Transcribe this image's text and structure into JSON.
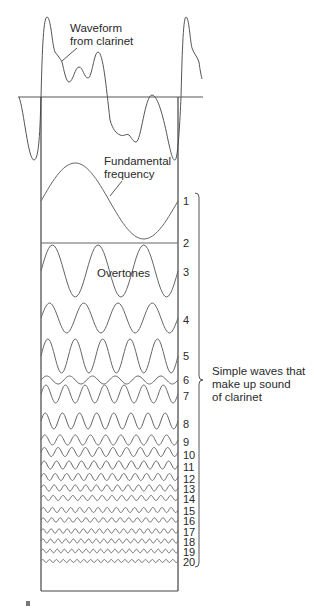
{
  "labels": {
    "waveform_line1": "Waveform",
    "waveform_line2": "from clarinet",
    "fundamental_line1": "Fundamental",
    "fundamental_line2": "frequency",
    "overtones": "Overtones",
    "bracket_line1": "Simple waves that",
    "bracket_line2": "make up sound",
    "bracket_line3": "of clarinet"
  },
  "colors": {
    "line": "#555555",
    "wave": "#666666",
    "text": "#2a2a2a"
  },
  "box": {
    "x1": 41,
    "x2": 178,
    "top": 97,
    "bottom": 591
  },
  "axis": {
    "y": 97,
    "x1": 18,
    "x2": 203
  },
  "harmonics": [
    {
      "n": "1",
      "cycles": 1,
      "cy": 201,
      "amp": 38,
      "label_y": 205
    },
    {
      "n": "2",
      "cycles": 0,
      "cy": 243,
      "amp": 0,
      "label_y": 247
    },
    {
      "n": "3",
      "cycles": 3,
      "cy": 271,
      "amp": 26,
      "label_y": 276
    },
    {
      "n": "4",
      "cycles": 4,
      "cy": 318,
      "amp": 15,
      "label_y": 324
    },
    {
      "n": "5",
      "cycles": 5,
      "cy": 356,
      "amp": 17,
      "label_y": 360
    },
    {
      "n": "6",
      "cycles": 6,
      "cy": 380,
      "amp": 4,
      "label_y": 384
    },
    {
      "n": "7",
      "cycles": 7,
      "cy": 394,
      "amp": 9,
      "label_y": 400
    },
    {
      "n": "8",
      "cycles": 8,
      "cy": 421,
      "amp": 8,
      "label_y": 428
    },
    {
      "n": "9",
      "cycles": 9,
      "cy": 440,
      "amp": 5,
      "label_y": 446
    },
    {
      "n": "10",
      "cycles": 10,
      "cy": 452,
      "amp": 4.5,
      "label_y": 459
    },
    {
      "n": "11",
      "cycles": 11,
      "cy": 465,
      "amp": 4,
      "label_y": 471
    },
    {
      "n": "12",
      "cycles": 12,
      "cy": 477,
      "amp": 3.5,
      "label_y": 483
    },
    {
      "n": "13",
      "cycles": 13,
      "cy": 488,
      "amp": 3,
      "label_y": 493
    },
    {
      "n": "14",
      "cycles": 14,
      "cy": 498,
      "amp": 2.5,
      "label_y": 503
    },
    {
      "n": "15",
      "cycles": 15,
      "cy": 510,
      "amp": 2.5,
      "label_y": 515
    },
    {
      "n": "16",
      "cycles": 16,
      "cy": 520,
      "amp": 2.2,
      "label_y": 525
    },
    {
      "n": "17",
      "cycles": 17,
      "cy": 531,
      "amp": 2.2,
      "label_y": 536
    },
    {
      "n": "18",
      "cycles": 18,
      "cy": 541,
      "amp": 2,
      "label_y": 546
    },
    {
      "n": "19",
      "cycles": 19,
      "cy": 551,
      "amp": 1.8,
      "label_y": 556
    },
    {
      "n": "20",
      "cycles": 20,
      "cy": 561,
      "amp": 1.5,
      "label_y": 566
    }
  ],
  "bracket": {
    "x": 199,
    "top": 193,
    "bottom": 567,
    "tick_y": 380
  }
}
